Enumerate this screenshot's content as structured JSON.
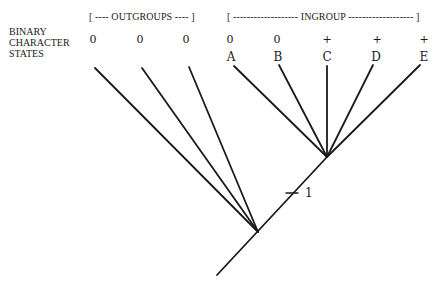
{
  "row_label": [
    "BINARY",
    "CHARACTER",
    "STATES"
  ],
  "outgroup_header": "[ ---- OUTGROUPS ---- ]",
  "ingroup_header": "[ ------------------- INGROUP ------------------- ]",
  "outgroups": [
    {
      "state": "0"
    },
    {
      "state": "0"
    },
    {
      "state": "0"
    }
  ],
  "ingroup": [
    {
      "taxon": "A",
      "state": "0"
    },
    {
      "taxon": "B",
      "state": "0"
    },
    {
      "taxon": "C",
      "state": "+"
    },
    {
      "taxon": "D",
      "state": "+"
    },
    {
      "taxon": "E",
      "state": "+"
    }
  ],
  "synapomorphy_label": "1"
}
